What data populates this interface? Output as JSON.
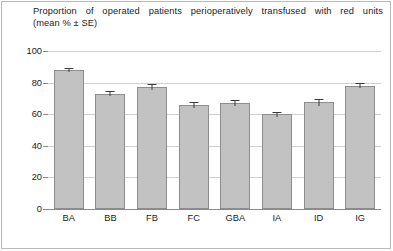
{
  "title": {
    "line1": "Proportion of operated patients perioperatively transfused with red units",
    "line2": "(mean % ± SE)"
  },
  "chart_data": {
    "type": "bar",
    "title": "Proportion of operated patients perioperatively transfused with red units (mean % ± SE)",
    "xlabel": "",
    "ylabel": "",
    "categories": [
      "BA",
      "BB",
      "FB",
      "FC",
      "GBA",
      "IA",
      "ID",
      "IG"
    ],
    "values": [
      88,
      73,
      77,
      66,
      67,
      60,
      67.5,
      78
    ],
    "errors": [
      1.5,
      1.5,
      2,
      2,
      2,
      1.5,
      2,
      1.5
    ],
    "series": [
      {
        "name": "Proportion transfused (mean %)",
        "values": [
          88,
          73,
          77,
          66,
          67,
          60,
          67.5,
          78
        ],
        "errors": [
          1.5,
          1.5,
          2,
          2,
          2,
          1.5,
          2,
          1.5
        ]
      }
    ],
    "ylim": [
      0,
      100
    ],
    "yticks": [
      0,
      20,
      40,
      60,
      80,
      100
    ],
    "ytick_labels": [
      "0",
      "20",
      "40",
      "60",
      "80",
      "100"
    ],
    "grid": true,
    "grid_axis": "y",
    "legend": false,
    "bar_color": "#c2c2c2",
    "bar_edge_color": "#8d8d8d",
    "error_color": "#3a3a3a",
    "grid_color": "#cfcfcf",
    "axis_color": "#8a8a8a"
  }
}
